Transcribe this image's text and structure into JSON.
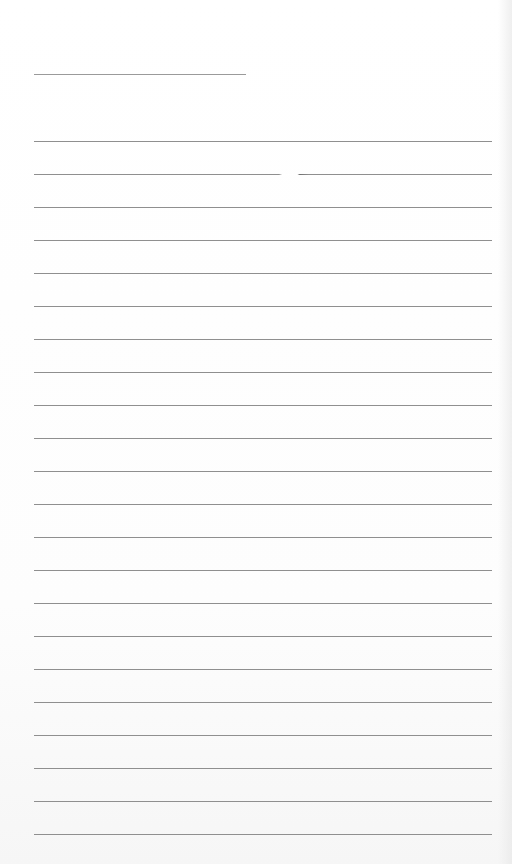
{
  "document": {
    "type": "blank lined page",
    "header_line": {
      "left": 34,
      "top": 74,
      "width": 212
    },
    "ruled_lines": {
      "count": 22,
      "left": 34,
      "width": 458,
      "first_top": 141,
      "spacing": 33,
      "gap_line_index": 1
    },
    "colors": {
      "paper": "#fdfdfd",
      "line": "#8f8f8f"
    }
  }
}
